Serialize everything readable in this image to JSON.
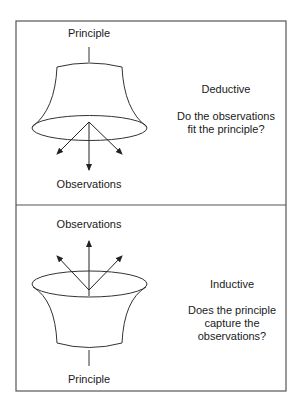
{
  "panels": [
    {
      "id": "deductive",
      "top_label": "Principle",
      "bottom_label": "Observations",
      "title": "Deductive",
      "question_line1": "Do the observations",
      "question_line2": "fit the principle?"
    },
    {
      "id": "inductive",
      "top_label": "Observations",
      "bottom_label": "Principle",
      "title": "Inductive",
      "question_line1": "Does the principle",
      "question_line2": "capture the",
      "question_line3": "observations?"
    }
  ],
  "colors": {
    "stroke": "#333333",
    "border": "#555555",
    "background": "#ffffff"
  }
}
